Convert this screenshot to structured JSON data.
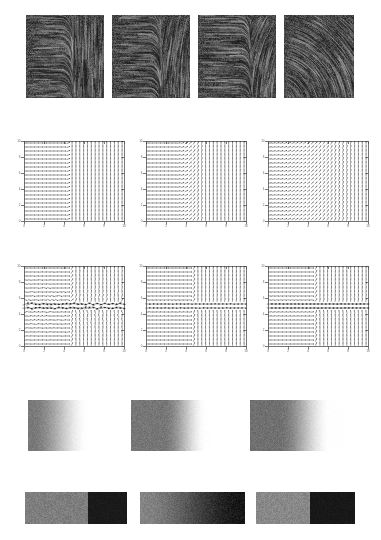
{
  "figure": {
    "width": 381,
    "height": 540,
    "background": "#ffffff"
  },
  "chart_data": [
    {
      "type": "heatmap",
      "panel_id": "row1-lic-textures",
      "title": "",
      "xlabel": "",
      "ylabel": "",
      "grid": false,
      "legend": "none",
      "colormap": "gray",
      "vmin": 0,
      "vmax": 1,
      "panels": [
        {
          "label": "a",
          "x": 26,
          "y": 15,
          "w": 78,
          "h": 83,
          "field": "split-horizontal-vertical",
          "split_x_frac": 0.52,
          "curvature": 0.0,
          "noise_seed": 11,
          "base_gray": "#3d3d3d",
          "streak_gray": "#141414"
        },
        {
          "label": "b",
          "x": 112,
          "y": 15,
          "w": 78,
          "h": 83,
          "field": "split-horizontal-vertical",
          "split_x_frac": 0.55,
          "curvature": 0.35,
          "noise_seed": 23,
          "base_gray": "#3d3d3d",
          "streak_gray": "#141414"
        },
        {
          "label": "c",
          "x": 198,
          "y": 15,
          "w": 78,
          "h": 83,
          "field": "split-horizontal-vertical",
          "split_x_frac": 0.62,
          "curvature": 0.75,
          "noise_seed": 37,
          "base_gray": "#3d3d3d",
          "streak_gray": "#141414"
        },
        {
          "label": "d",
          "x": 284,
          "y": 15,
          "w": 70,
          "h": 83,
          "field": "radial-swirl",
          "split_x_frac": 1.0,
          "curvature": 1.0,
          "noise_seed": 51,
          "base_gray": "#3d3d3d",
          "streak_gray": "#141414"
        }
      ]
    },
    {
      "type": "scatter",
      "panel_id": "row2-quiver-plots",
      "title": "",
      "xlabel": "",
      "ylabel": "",
      "grid": false,
      "legend": "none",
      "xlim": [
        0,
        10
      ],
      "ylim": [
        0,
        10
      ],
      "xticks": [
        0,
        2,
        4,
        6,
        8,
        10
      ],
      "yticks": [
        0,
        2,
        4,
        6,
        8,
        10
      ],
      "xticklabels": [
        "0",
        "2",
        "4",
        "6",
        "8",
        "10"
      ],
      "yticklabels": [
        "0",
        "2",
        "4",
        "6",
        "8",
        "10"
      ],
      "arrow_color": "#1a1a1a",
      "frame_color": "#555555",
      "panels": [
        {
          "label": "a",
          "x": 15,
          "y": 139,
          "w": 111,
          "h": 91,
          "nx": 26,
          "ny": 20,
          "split_x_frac": 0.45,
          "transition_width": 0.03,
          "arrow_scale": 1.0,
          "left_dir_deg": 0,
          "right_dir_deg": 90
        },
        {
          "label": "b",
          "x": 137,
          "y": 139,
          "w": 111,
          "h": 91,
          "nx": 26,
          "ny": 20,
          "split_x_frac": 0.45,
          "transition_width": 0.3,
          "arrow_scale": 1.0,
          "left_dir_deg": 0,
          "right_dir_deg": 90
        },
        {
          "label": "c",
          "x": 259,
          "y": 139,
          "w": 111,
          "h": 91,
          "nx": 26,
          "ny": 20,
          "split_x_frac": 0.45,
          "transition_width": 1.0,
          "arrow_scale": 1.0,
          "left_dir_deg": 0,
          "right_dir_deg": 90
        }
      ]
    },
    {
      "type": "scatter",
      "panel_id": "row3-quiver-plots",
      "title": "",
      "xlabel": "",
      "ylabel": "",
      "grid": false,
      "legend": "none",
      "xlim": [
        0,
        10
      ],
      "ylim": [
        0,
        10
      ],
      "xticks": [
        0,
        2,
        4,
        6,
        8,
        10
      ],
      "yticks": [
        0,
        2,
        4,
        6,
        8,
        10
      ],
      "xticklabels": [
        "0",
        "2",
        "4",
        "6",
        "8",
        "10"
      ],
      "yticklabels": [
        "0",
        "2",
        "4",
        "6",
        "8",
        "10"
      ],
      "arrow_color": "#1a1a1a",
      "frame_color": "#555555",
      "panels": [
        {
          "label": "a",
          "x": 15,
          "y": 264,
          "w": 111,
          "h": 91,
          "nx": 26,
          "ny": 20,
          "split_x_frac": 0.47,
          "transition_width": 0.05,
          "arrow_scale": 1.0,
          "left_dir_deg": 0,
          "right_dir_deg": 90,
          "shear_band": true,
          "band_y_frac": 0.5,
          "band_strength": 1.0,
          "noise_level": 0.55
        },
        {
          "label": "b",
          "x": 137,
          "y": 264,
          "w": 111,
          "h": 91,
          "nx": 26,
          "ny": 20,
          "split_x_frac": 0.47,
          "transition_width": 0.05,
          "arrow_scale": 1.0,
          "left_dir_deg": 0,
          "right_dir_deg": 90,
          "shear_band": true,
          "band_y_frac": 0.5,
          "band_strength": 0.55,
          "noise_level": 0.12
        },
        {
          "label": "c",
          "x": 259,
          "y": 264,
          "w": 111,
          "h": 91,
          "nx": 26,
          "ny": 20,
          "split_x_frac": 0.47,
          "transition_width": 0.05,
          "arrow_scale": 1.0,
          "left_dir_deg": 0,
          "right_dir_deg": 90,
          "shear_band": true,
          "band_y_frac": 0.5,
          "band_strength": 0.85,
          "noise_level": 0.05
        }
      ]
    },
    {
      "type": "heatmap",
      "panel_id": "row4-scalar-fields",
      "title": "",
      "xlabel": "",
      "ylabel": "",
      "grid": false,
      "legend": "none",
      "colormap": "gray_r",
      "vmin": 0,
      "vmax": 1,
      "panels": [
        {
          "label": "a",
          "x": 28,
          "y": 400,
          "w": 61,
          "h": 51,
          "left_gray": 120,
          "right_gray": 255,
          "ramp_start_frac": 0.05,
          "ramp_end_frac": 1.0,
          "noise_amp": 22,
          "noise_seed": 7
        },
        {
          "label": "b",
          "x": 131,
          "y": 400,
          "w": 80,
          "h": 51,
          "left_gray": 118,
          "right_gray": 255,
          "ramp_start_frac": 0.4,
          "ramp_end_frac": 0.95,
          "noise_amp": 22,
          "noise_seed": 19
        },
        {
          "label": "c",
          "x": 250,
          "y": 400,
          "w": 95,
          "h": 51,
          "left_gray": 112,
          "right_gray": 255,
          "ramp_start_frac": 0.3,
          "ramp_end_frac": 0.85,
          "noise_amp": 22,
          "noise_seed": 29
        }
      ]
    },
    {
      "type": "heatmap",
      "panel_id": "row5-two-tone-bars",
      "title": "",
      "xlabel": "",
      "ylabel": "",
      "grid": false,
      "legend": "none",
      "colormap": "gray",
      "vmin": 0,
      "vmax": 1,
      "panels": [
        {
          "label": "a",
          "x": 25,
          "y": 492,
          "w": 102,
          "h": 32,
          "split_frac": 0.62,
          "left_gray": 126,
          "right_gray": 26,
          "gradient": false,
          "noise_amp": 26,
          "noise_seed": 3
        },
        {
          "label": "b",
          "x": 140,
          "y": 492,
          "w": 105,
          "h": 32,
          "split_frac": 1.0,
          "left_gray": 132,
          "right_gray": 22,
          "gradient": true,
          "noise_amp": 24,
          "noise_seed": 13
        },
        {
          "label": "c",
          "x": 256,
          "y": 492,
          "w": 99,
          "h": 32,
          "split_frac": 0.55,
          "left_gray": 136,
          "right_gray": 24,
          "gradient": false,
          "noise_amp": 26,
          "noise_seed": 41
        }
      ]
    }
  ]
}
